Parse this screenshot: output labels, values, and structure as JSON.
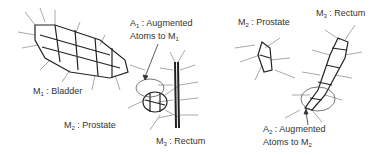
{
  "labels": {
    "m1_bladder": {
      "sym": "M",
      "sub": "1",
      "text": " : Bladder"
    },
    "a1": {
      "sym": "A",
      "sub": "1",
      "text": " : Augmented",
      "line2": "Atoms to M",
      "line2_sub": "1"
    },
    "m2_prostate_left": {
      "sym": "M",
      "sub": "2",
      "text": " : Prostate"
    },
    "m3_rectum_left": {
      "sym": "M",
      "sub": "3",
      "text": " : Rectum"
    },
    "m2_prostate_right": {
      "sym": "M",
      "sub": "2",
      "text": " : Prostate"
    },
    "m3_rectum_right": {
      "sym": "M",
      "sub": "3",
      "text": " : Rectum"
    },
    "a2": {
      "sym": "A",
      "sub": "2",
      "text": " : Augmented",
      "line2": "Atoms to M",
      "line2_sub": "2"
    }
  },
  "colors": {
    "mesh": "#222222",
    "spokes": "#9a9a9a",
    "text": "#333333"
  }
}
